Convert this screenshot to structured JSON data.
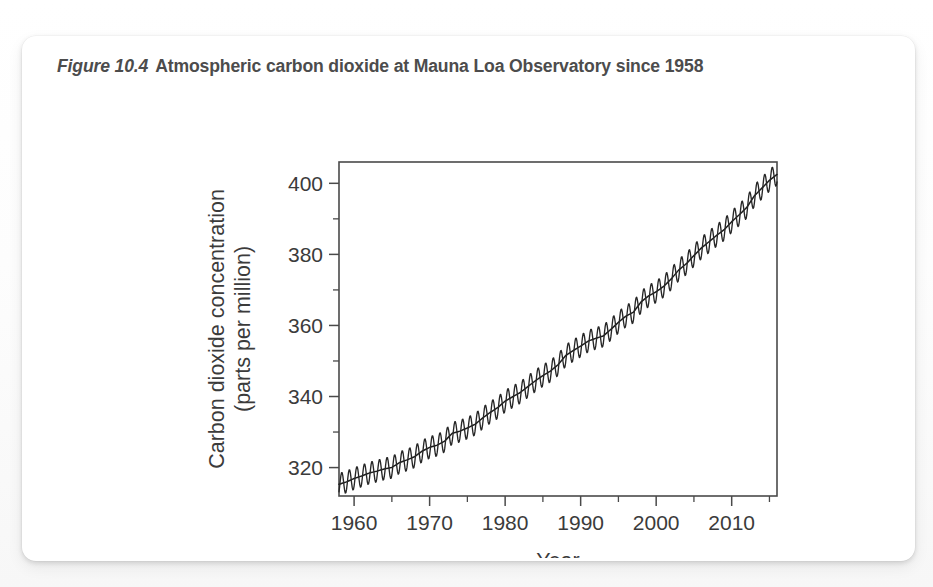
{
  "figure": {
    "label": "Figure 10.4",
    "caption": "Atmospheric carbon dioxide at Mauna Loa Observatory since 1958"
  },
  "chart_data": {
    "type": "line",
    "title": "Atmospheric carbon dioxide at Mauna Loa Observatory since 1958",
    "xlabel": "Year",
    "ylabel": "Carbon dioxide concentration (parts per million)",
    "ylabel_line1": "Carbon dioxide concentration",
    "ylabel_line2": "(parts per million)",
    "xlim": [
      1958,
      2016
    ],
    "ylim": [
      312,
      406
    ],
    "grid": false,
    "legend": "none",
    "line_color": "#262626",
    "xticks": [
      1960,
      1970,
      1980,
      1990,
      2000,
      2010
    ],
    "xtick_labels": [
      "1960",
      "1970",
      "1980",
      "1990",
      "2000",
      "2010"
    ],
    "xticks_minor": [
      1965,
      1975,
      1985,
      1995,
      2005,
      2015
    ],
    "yticks": [
      320,
      340,
      360,
      380,
      400
    ],
    "ytick_labels": [
      "320",
      "340",
      "360",
      "380",
      "400"
    ],
    "yticks_minor": [
      330,
      350,
      370,
      390
    ],
    "seasonal_amplitude_ppm": 3.1,
    "series_name": "Monthly mean CO2 (ppm)",
    "annual_mean": {
      "x": [
        1958,
        1959,
        1960,
        1961,
        1962,
        1963,
        1964,
        1965,
        1966,
        1967,
        1968,
        1969,
        1970,
        1971,
        1972,
        1973,
        1974,
        1975,
        1976,
        1977,
        1978,
        1979,
        1980,
        1981,
        1982,
        1983,
        1984,
        1985,
        1986,
        1987,
        1988,
        1989,
        1990,
        1991,
        1992,
        1993,
        1994,
        1995,
        1996,
        1997,
        1998,
        1999,
        2000,
        2001,
        2002,
        2003,
        2004,
        2005,
        2006,
        2007,
        2008,
        2009,
        2010,
        2011,
        2012,
        2013,
        2014,
        2015,
        2016
      ],
      "y": [
        315.3,
        315.98,
        316.91,
        317.64,
        318.45,
        318.99,
        319.62,
        320.04,
        321.38,
        322.16,
        323.04,
        324.62,
        325.68,
        326.32,
        327.45,
        329.68,
        330.25,
        331.15,
        332.15,
        333.9,
        335.5,
        336.85,
        338.69,
        339.93,
        341.13,
        342.78,
        344.42,
        345.9,
        347.15,
        348.93,
        351.48,
        352.91,
        354.19,
        355.59,
        356.37,
        357.04,
        358.89,
        360.88,
        362.64,
        363.76,
        366.63,
        368.31,
        369.48,
        371.02,
        373.1,
        375.64,
        377.38,
        379.67,
        381.84,
        383.55,
        385.34,
        386.95,
        389.21,
        391.15,
        393.22,
        396.48,
        398.65,
        400.83,
        402.5
      ]
    }
  }
}
